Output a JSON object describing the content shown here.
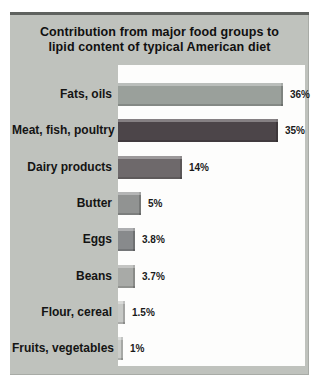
{
  "figure": {
    "title_line1": "Contribution from major food groups to",
    "title_line2": "lipid content of typical American diet",
    "panel_bg": "#bfc2bd",
    "plot_bg": "#fdfdfc"
  },
  "chart_data": {
    "type": "bar",
    "orientation": "horizontal",
    "title": "Contribution from major food groups to lipid content of typical American diet",
    "xlabel": "",
    "ylabel": "",
    "xlim": [
      0,
      40
    ],
    "grid": false,
    "legend": "none",
    "categories": [
      "Fats, oils",
      "Meat, fish, poultry",
      "Dairy products",
      "Butter",
      "Eggs",
      "Beans",
      "Flour, cereal",
      "Fruits, vegetables"
    ],
    "values": [
      36,
      35,
      14,
      5,
      3.8,
      3.7,
      1.5,
      1
    ],
    "value_labels": [
      "36%",
      "35%",
      "14%",
      "5%",
      "3.8%",
      "3.7%",
      "1.5%",
      "1%"
    ],
    "bar_colors": [
      "#9aa09b",
      "#4c4549",
      "#6e696b",
      "#919392",
      "#888a8c",
      "#a8aaa7",
      "#c7c9c6",
      "#cbcdca"
    ]
  }
}
